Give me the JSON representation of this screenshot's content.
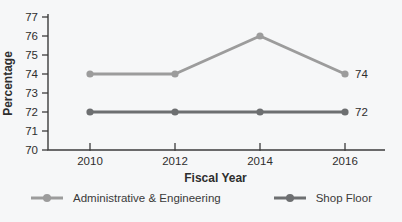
{
  "chart_data": {
    "type": "line",
    "categories": [
      "2010",
      "2012",
      "2014",
      "2016"
    ],
    "series": [
      {
        "name": "Administrative & Engineering",
        "values": [
          74,
          74,
          76,
          74
        ],
        "color": "#9c9c9c",
        "end_label": "74"
      },
      {
        "name": "Shop Floor",
        "values": [
          72,
          72,
          72,
          72
        ],
        "color": "#6d6f71",
        "end_label": "72"
      }
    ],
    "title": "",
    "xlabel": "Fiscal Year",
    "ylabel": "Percentage",
    "ylim": [
      70,
      77
    ],
    "ytick_step": 1,
    "yticks": [
      70,
      71,
      72,
      73,
      74,
      75,
      76,
      77
    ],
    "grid": false,
    "legend_position": "bottom",
    "colors": {
      "background": "#f6f7f8",
      "axis": "#3c3c3c",
      "text": "#2e2e2e"
    }
  },
  "legend": {
    "items": [
      {
        "label": "Administrative & Engineering"
      },
      {
        "label": "Shop Floor"
      }
    ]
  }
}
